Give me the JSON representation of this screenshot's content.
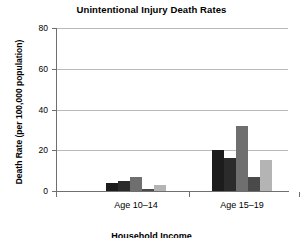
{
  "chart_data": {
    "type": "bar",
    "title": "Unintentional Injury Death Rates",
    "xlabel": "Household Income",
    "ylabel": "Death Rate (per 100,000 population)",
    "categories": [
      "Age 10–14",
      "Age 15–19"
    ],
    "ylim": [
      0,
      80
    ],
    "yticks": [
      0,
      20,
      40,
      60,
      80
    ],
    "ytick_labels": [
      "0",
      "20",
      "40",
      "60",
      "80"
    ],
    "grid": true,
    "legend": "none",
    "series": [
      {
        "name": "Series 1",
        "color": "#1c1c1c",
        "values": [
          4,
          20
        ]
      },
      {
        "name": "Series 2",
        "color": "#2b2b2b",
        "values": [
          5,
          16
        ]
      },
      {
        "name": "Series 3",
        "color": "#6f6f6f",
        "values": [
          7,
          32
        ]
      },
      {
        "name": "Series 4",
        "color": "#4a4a4a",
        "values": [
          1,
          7
        ]
      },
      {
        "name": "Series 5",
        "color": "#b4b4b4",
        "values": [
          3,
          15
        ]
      }
    ]
  }
}
